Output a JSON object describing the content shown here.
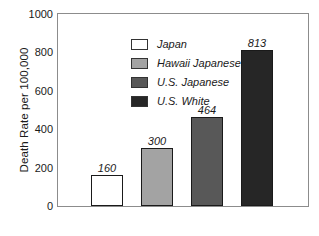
{
  "chart_data": {
    "type": "bar",
    "title": "",
    "subtitle": "",
    "xlabel": "",
    "ylabel": "Death Rate per 100,000",
    "ylim": [
      0,
      1000
    ],
    "ytick_labels": [
      "1000",
      "800",
      "600",
      "400",
      "200",
      "0"
    ],
    "ytick_values": [
      1000,
      800,
      600,
      400,
      200,
      0
    ],
    "grid": false,
    "legend_position": "upper-left-inside",
    "categories": [
      "Japan",
      "Hawaii Japanese",
      "U.S. Japanese",
      "U.S. White"
    ],
    "values": [
      160,
      300,
      464,
      813
    ],
    "value_labels": [
      "160",
      "300",
      "464",
      "813"
    ],
    "series": [
      {
        "name": "Death Rate per 100,000",
        "values": [
          160,
          300,
          464,
          813
        ]
      }
    ],
    "bar_colors": [
      "#ffffff",
      "#a3a3a3",
      "#585858",
      "#262626"
    ],
    "bar_edge_colors": [
      "#1a1a1a",
      "#1a1a1a",
      "#1a1a1a",
      "#1a1a1a"
    ],
    "legend": [
      {
        "label": "Japan",
        "color": "#ffffff"
      },
      {
        "label": "Hawaii Japanese",
        "color": "#a3a3a3"
      },
      {
        "label": "U.S. Japanese",
        "color": "#585858"
      },
      {
        "label": "U.S. White",
        "color": "#262626"
      }
    ],
    "frame_color": "#8c8c8c",
    "text_color": "#1a1a1a"
  }
}
